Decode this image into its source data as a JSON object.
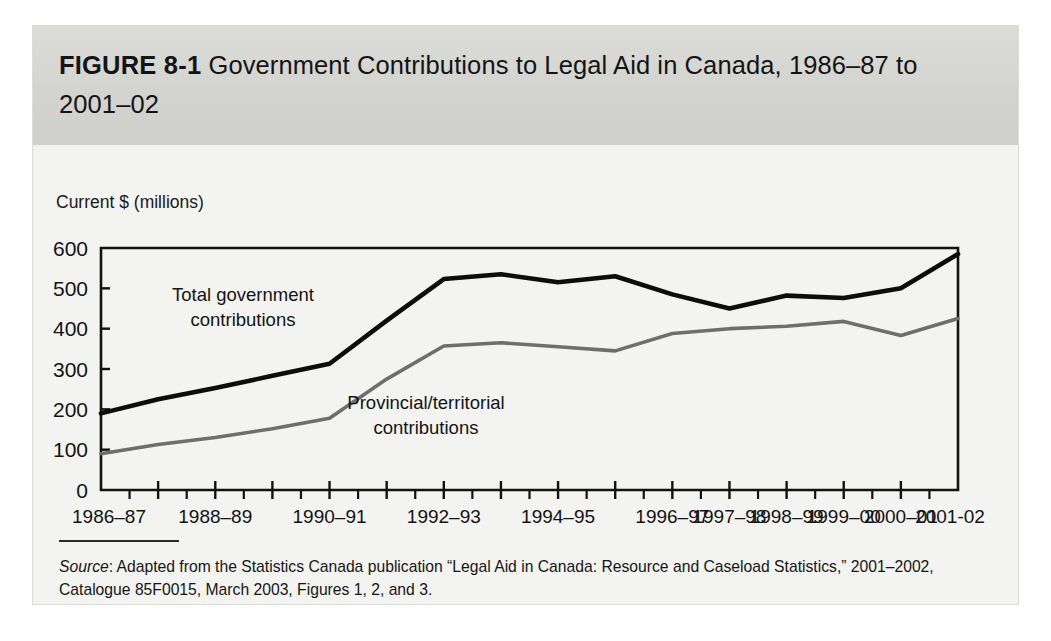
{
  "figure": {
    "label": "FIGURE 8-1",
    "title": "Government Contributions to Legal Aid in Canada, 1986–87 to 2001–02",
    "title_line1": "FIGURE 8-1  Government Contributions to Legal Aid in Canada,",
    "title_line2": "1986–87 to 2001–02",
    "band_color": "#d6d6d2",
    "card_color": "#f3f3f1"
  },
  "source": {
    "lead": "Source",
    "text": ": Adapted from the Statistics Canada publication “Legal Aid in Canada: Resource and Caseload Statistics,” 2001–2002, Catalogue 85F0015, March 2003, Figures 1, 2, and 3."
  },
  "chart_data": {
    "type": "line",
    "title": "Government Contributions to Legal Aid in Canada, 1986–87 to 2001–02",
    "xlabel": "",
    "ylabel": "Current $ (millions)",
    "ylim": [
      0,
      600
    ],
    "yticks": [
      0,
      100,
      200,
      300,
      400,
      500,
      600
    ],
    "ytick_labels": [
      "0",
      "100",
      "200",
      "300",
      "400",
      "500",
      "600"
    ],
    "grid": false,
    "legend": "inline annotations",
    "x": [
      "1986–87",
      "1987–88",
      "1988–89",
      "1989–90",
      "1990–91",
      "1991–92",
      "1992–93",
      "1993–94",
      "1994–95",
      "1995–96",
      "1996–97",
      "1997–98",
      "1998–99",
      "1999–00",
      "2000–01",
      "2001-02"
    ],
    "xtick_labels_shown": [
      "1986–87",
      "1988–89",
      "1990–91",
      "1992–93",
      "1994–95",
      "1996–97",
      "1997–98",
      "1998–99",
      "1999–00",
      "2000–01",
      "2001-02"
    ],
    "series": [
      {
        "name": "Total government contributions",
        "color": "#0d0d0d",
        "values": [
          190,
          225,
          253,
          283,
          313,
          420,
          523,
          535,
          515,
          530,
          485,
          450,
          482,
          476,
          500,
          585
        ]
      },
      {
        "name": "Provincial/territorial contributions",
        "color": "#6e6e6e",
        "values": [
          90,
          113,
          130,
          152,
          178,
          275,
          357,
          365,
          355,
          345,
          388,
          400,
          406,
          418,
          383,
          425
        ]
      }
    ],
    "annotations": [
      {
        "text_line1": "Total government",
        "text_line2": "contributions",
        "series": "Total government contributions"
      },
      {
        "text_line1": "Provincial/territorial",
        "text_line2": "contributions",
        "series": "Provincial/territorial contributions"
      }
    ]
  }
}
